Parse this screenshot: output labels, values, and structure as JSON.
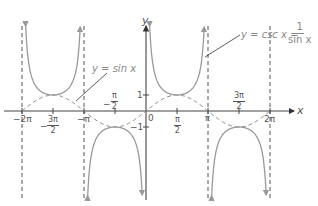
{
  "chart_data": {
    "type": "line",
    "title": "",
    "xlabel": "x",
    "ylabel": "y",
    "xlim": [
      -6.6,
      7.0
    ],
    "ylim": [
      -5.8,
      5.8
    ],
    "grid": false,
    "series": [
      {
        "name": "y = sin x",
        "style": "dashed",
        "function": "sin(x)"
      },
      {
        "name": "y = csc x = 1/sin x",
        "style": "solid",
        "function": "1/sin(x)"
      }
    ],
    "asymptotes": [
      "-2π",
      "-π",
      "π",
      "2π"
    ],
    "x_ticks": [
      "-2π",
      "-3π/2",
      "-π",
      "-π/2",
      "0",
      "π/2",
      "π",
      "3π/2",
      "2π"
    ],
    "y_ticks": [
      "1",
      "-1"
    ]
  },
  "labels": {
    "y_axis": "y",
    "x_axis": "x",
    "origin": "0",
    "y_one": "1",
    "y_minus_one": "−1",
    "sin_eq": "y = sin x",
    "csc_eq_prefix": "y = csc x =",
    "csc_num": "1",
    "csc_den": "sin x",
    "neg_two_pi": "−2π",
    "neg_pi": "−π",
    "pi": "π",
    "two_pi": "2π",
    "pi_sym": "π",
    "two": "2",
    "three_pi": "3π",
    "minus": "−"
  },
  "colors": {
    "axis": "#444444",
    "curve": "#9a9a9a",
    "dashed": "#888888",
    "text": "#555555"
  }
}
